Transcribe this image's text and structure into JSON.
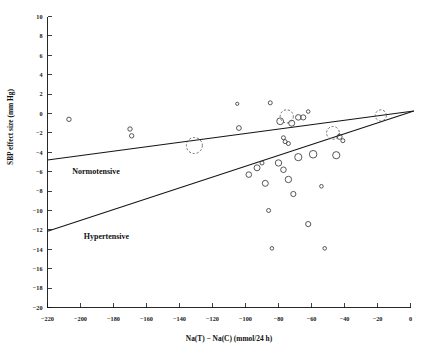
{
  "chart_data": {
    "type": "scatter",
    "title": "",
    "xlabel": "Na(T) − Na(C) (mmol/24 h)",
    "ylabel": "SBP effect size (mm Hg)",
    "xlim": [
      -220,
      0
    ],
    "ylim": [
      -20,
      10
    ],
    "xticks": [
      -220,
      -200,
      -180,
      -160,
      -140,
      -120,
      -100,
      -80,
      -60,
      -40,
      -20,
      0
    ],
    "xticklabels": [
      "-220",
      "-200",
      "-180",
      "-160",
      "-140",
      "-120",
      "-100",
      "-80",
      "-60",
      "-40",
      "-20",
      "0"
    ],
    "yticks": [
      10,
      8,
      6,
      4,
      2,
      0,
      -2,
      -4,
      -6,
      -8,
      -10,
      -12,
      -14,
      -16,
      -18,
      -20
    ],
    "yticklabels": [
      "10",
      "8",
      "6",
      "4",
      "2",
      "0",
      "-2",
      "-4",
      "-6",
      "-8",
      "-10",
      "-12",
      "-14",
      "-16",
      "-18",
      "-20"
    ],
    "grid": false,
    "legend_position": "inline-annotations",
    "annotations": [
      {
        "text": "Normotensive",
        "x": -205,
        "y": -6.2
      },
      {
        "text": "Hypertensive",
        "x": -198,
        "y": -12.9
      }
    ],
    "series": [
      {
        "name": "Normotensive trial estimates",
        "marker": "open-circle",
        "note": "bubble radius encodes trial weight; dashed circles are the largest-weight trials",
        "points": [
          {
            "x": -207,
            "y": -0.6,
            "size": 2.2,
            "style": "solid"
          },
          {
            "x": -170,
            "y": -1.6,
            "size": 2.2,
            "style": "solid"
          },
          {
            "x": -169,
            "y": -2.3,
            "size": 2.2,
            "style": "solid"
          },
          {
            "x": -131,
            "y": -3.3,
            "size": 8.0,
            "style": "dashed"
          },
          {
            "x": -105,
            "y": 1.0,
            "size": 1.6,
            "style": "solid"
          },
          {
            "x": -104,
            "y": -1.5,
            "size": 2.4,
            "style": "solid"
          },
          {
            "x": -85,
            "y": 1.1,
            "size": 2.0,
            "style": "solid"
          },
          {
            "x": -79,
            "y": -0.8,
            "size": 3.4,
            "style": "solid"
          },
          {
            "x": -77,
            "y": -2.5,
            "size": 2.0,
            "style": "solid"
          },
          {
            "x": -76,
            "y": -2.9,
            "size": 2.0,
            "style": "solid"
          },
          {
            "x": -75,
            "y": -0.3,
            "size": 6.6,
            "style": "dashed"
          },
          {
            "x": -74,
            "y": -3.1,
            "size": 2.0,
            "style": "solid"
          },
          {
            "x": -72,
            "y": -1.0,
            "size": 3.0,
            "style": "solid"
          },
          {
            "x": -68,
            "y": -0.4,
            "size": 2.8,
            "style": "solid"
          },
          {
            "x": -65,
            "y": -0.4,
            "size": 2.6,
            "style": "solid"
          },
          {
            "x": -62,
            "y": 0.2,
            "size": 1.8,
            "style": "solid"
          },
          {
            "x": -47,
            "y": -2.0,
            "size": 6.4,
            "style": "dashed"
          },
          {
            "x": -43,
            "y": -2.4,
            "size": 2.6,
            "style": "solid"
          },
          {
            "x": -41,
            "y": -2.8,
            "size": 2.0,
            "style": "solid"
          },
          {
            "x": -18,
            "y": -0.2,
            "size": 5.6,
            "style": "dashed"
          }
        ]
      },
      {
        "name": "Hypertensive trial estimates",
        "marker": "open-circle",
        "points": [
          {
            "x": -98,
            "y": -6.3,
            "size": 2.8,
            "style": "solid"
          },
          {
            "x": -93,
            "y": -5.6,
            "size": 3.0,
            "style": "solid"
          },
          {
            "x": -90,
            "y": -5.1,
            "size": 2.0,
            "style": "solid"
          },
          {
            "x": -88,
            "y": -7.2,
            "size": 3.0,
            "style": "solid"
          },
          {
            "x": -86,
            "y": -10.0,
            "size": 2.0,
            "style": "solid"
          },
          {
            "x": -84,
            "y": -13.9,
            "size": 1.8,
            "style": "solid"
          },
          {
            "x": -80,
            "y": -5.1,
            "size": 3.2,
            "style": "solid"
          },
          {
            "x": -77,
            "y": -5.8,
            "size": 2.8,
            "style": "solid"
          },
          {
            "x": -74,
            "y": -6.8,
            "size": 3.2,
            "style": "solid"
          },
          {
            "x": -71,
            "y": -8.3,
            "size": 2.6,
            "style": "solid"
          },
          {
            "x": -68,
            "y": -4.5,
            "size": 3.6,
            "style": "solid"
          },
          {
            "x": -62,
            "y": -11.4,
            "size": 2.6,
            "style": "solid"
          },
          {
            "x": -59,
            "y": -4.2,
            "size": 3.8,
            "style": "solid"
          },
          {
            "x": -54,
            "y": -7.5,
            "size": 1.8,
            "style": "solid"
          },
          {
            "x": -52,
            "y": -13.9,
            "size": 1.8,
            "style": "solid"
          },
          {
            "x": -45,
            "y": -4.3,
            "size": 3.6,
            "style": "solid"
          }
        ]
      }
    ],
    "regression_lines": [
      {
        "name": "Normotensive",
        "x1": -220,
        "y1": -4.8,
        "x2": 2,
        "y2": 0.25
      },
      {
        "name": "Hypertensive",
        "x1": -220,
        "y1": -12.15,
        "x2": 2,
        "y2": 0.25
      }
    ]
  }
}
